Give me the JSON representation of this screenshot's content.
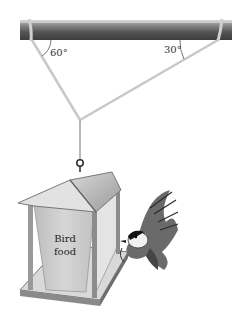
{
  "figure": {
    "angles": {
      "left": "60°",
      "right": "30°"
    },
    "feeder_label_line1": "Bird",
    "feeder_label_line2": "food",
    "colors": {
      "pipe_dark": "#5a5a5a",
      "pipe_light": "#b8b8b8",
      "cord": "#c8c8c8",
      "feeder_wood": "#8a8a8a",
      "feeder_panel": "#cfcfcf"
    }
  }
}
